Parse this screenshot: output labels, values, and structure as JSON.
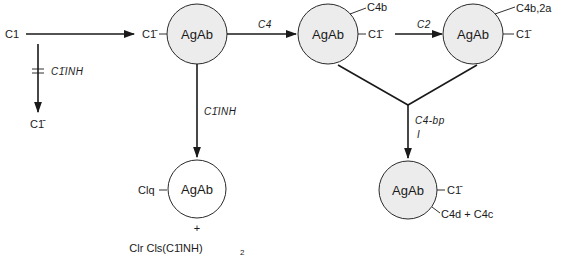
{
  "diagram": {
    "type": "complement activation pathway",
    "colors": {
      "ink": "#1a1a1a",
      "node_fill": "#ececec",
      "background": "#ffffff"
    },
    "start": {
      "label": "C1",
      "product_label": "C1̄",
      "blocked_by_label": "C1̄INH"
    },
    "nodes": [
      {
        "id": "n1",
        "label": "AgAb",
        "filled": true,
        "attached": [
          "C1̄"
        ]
      },
      {
        "id": "n2",
        "label": "AgAb",
        "filled": true,
        "attached": [
          "C4b",
          "C1̄"
        ]
      },
      {
        "id": "n3",
        "label": "AgAb",
        "filled": true,
        "attached": [
          "C4b,2a",
          "C1̄"
        ]
      },
      {
        "id": "n4",
        "label": "AgAb",
        "filled": false,
        "attached": [
          "Clq"
        ],
        "plus": "+",
        "released": "Clr Cls(C1̄INH)",
        "released_sub": "2"
      },
      {
        "id": "n5",
        "label": "AgAb",
        "filled": true,
        "attached": [
          "C1̄",
          "C4d + C4c"
        ]
      }
    ],
    "edges": [
      {
        "from": "C1",
        "to": "n1",
        "label": ""
      },
      {
        "from": "n1",
        "to": "n2",
        "label": "C4"
      },
      {
        "from": "n2",
        "to": "n3",
        "label": "C2"
      },
      {
        "from": "n1",
        "to": "n4",
        "label": "C1̄INH"
      },
      {
        "from": "n2+n3",
        "to": "n5",
        "label_line1": "C4-bp",
        "label_line2": "I"
      }
    ]
  }
}
